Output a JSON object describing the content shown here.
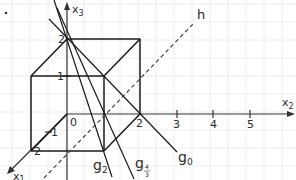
{
  "figure": {
    "background": "#ffffff",
    "grid_color": "#ececec",
    "line_color": "#1a1a1a",
    "axes": {
      "x1": {
        "label": "x",
        "sub": "1",
        "ticks": [
          "1",
          "2"
        ]
      },
      "x2": {
        "label": "x",
        "sub": "2",
        "ticks": [
          "2",
          "3",
          "4",
          "5"
        ]
      },
      "x3": {
        "label": "x",
        "sub": "3",
        "ticks": [
          "1",
          "2"
        ]
      },
      "origin": "0"
    },
    "cube": {
      "edge_length": 2
    },
    "lines": [
      {
        "name": "g2",
        "label": "g",
        "sub": "2"
      },
      {
        "name": "g4/3",
        "label": "g",
        "sub_num": "4",
        "sub_den": "3"
      },
      {
        "name": "g0",
        "label": "g",
        "sub": "0"
      },
      {
        "name": "h",
        "label": "h",
        "style": "dashed"
      }
    ]
  }
}
